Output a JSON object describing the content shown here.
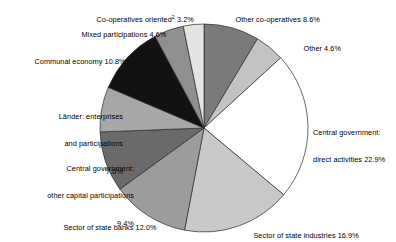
{
  "chart_data": {
    "type": "pie",
    "title": "",
    "subtitle": "",
    "xlabel": "",
    "ylabel": "",
    "legend_position": "none",
    "grid": false,
    "units": "percent",
    "total": 100.0,
    "start_angle_deg": 0,
    "direction": "clockwise",
    "categories": [
      "Other co-operatives",
      "Other",
      "Central government: direct activities",
      "Sector of state industries",
      "Sector of state banks",
      "Central government: other capital participations",
      "Länder: enterprises and participations",
      "Communal economy",
      "Mixed participations",
      "Co-operatives oriented"
    ],
    "values": [
      8.6,
      4.6,
      22.9,
      16.9,
      12.0,
      9.4,
      7.0,
      10.8,
      4.6,
      3.2
    ],
    "colors": [
      "#7a7a7a",
      "#c3c3c3",
      "#ffffff",
      "#c9c9c9",
      "#9c9c9c",
      "#6a6a6a",
      "#a8a8a8",
      "#121212",
      "#8f8f8f",
      "#e4e4e4"
    ],
    "slices": [
      {
        "label": "Other co-operatives",
        "value": 8.6,
        "value_text": "8.6%",
        "color": "#7a7a7a"
      },
      {
        "label": "Other",
        "value": 4.6,
        "value_text": "4.6%",
        "color": "#c3c3c3"
      },
      {
        "label": "Central government: direct activities",
        "value": 22.9,
        "value_text": "22.9%",
        "color": "#ffffff"
      },
      {
        "label": "Sector of state industries",
        "value": 16.9,
        "value_text": "16.9%",
        "color": "#c9c9c9"
      },
      {
        "label": "Sector of state banks",
        "value": 12.0,
        "value_text": "12.0%",
        "color": "#9c9c9c"
      },
      {
        "label": "Central government: other capital participations",
        "value": 9.4,
        "value_text": "9.4%",
        "color": "#6a6a6a"
      },
      {
        "label": "Länder: enterprises and participations",
        "value": 7.0,
        "value_text": "7.0%",
        "color": "#a8a8a8"
      },
      {
        "label": "Communal economy",
        "value": 10.8,
        "value_text": "10.8%",
        "color": "#121212"
      },
      {
        "label": "Mixed participations",
        "value": 4.6,
        "value_text": "4.6%",
        "color": "#8f8f8f"
      },
      {
        "label": "Co-operatives oriented",
        "value": 3.2,
        "value_text": "3.2%",
        "color": "#e4e4e4",
        "footnote_marker": "2"
      }
    ]
  },
  "labels": {
    "co_operatives_oriented": {
      "line1": "Co-operatives oriented",
      "marker": "2",
      "line1_value": " 3.2%"
    },
    "mixed_participations": {
      "line1": "Mixed participations 4.6%"
    },
    "communal_economy": {
      "line1": "Communal economy 10.8%"
    },
    "laender": {
      "line1": "Länder: enterprises",
      "line2": "and participations",
      "line3": "7.0%"
    },
    "central_gov_other_capital": {
      "line1": "Central government:",
      "line2": "other capital participations",
      "line3": "9.4%"
    },
    "sector_state_banks": {
      "line1": "Sector of state banks 12.0%"
    },
    "sector_state_industries": {
      "line1": "Sector of state industries 16.9%"
    },
    "central_gov_direct": {
      "line1": "Central government:",
      "line2": "direct activities 22.9%"
    },
    "other": {
      "line1": "Other 4.6%"
    },
    "other_co_operatives": {
      "line1": "Other co-operatives 8.6%"
    }
  },
  "geometry": {
    "center_x": 204,
    "center_y": 128,
    "radius": 104
  },
  "style": {
    "background": "#ffffff",
    "outline": "#2b2b2b",
    "text_color": "#000000"
  }
}
